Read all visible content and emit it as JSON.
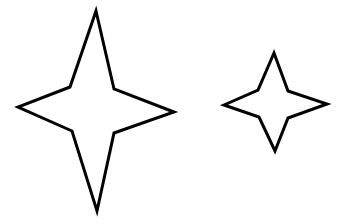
{
  "canvas": {
    "width": 341,
    "height": 224,
    "background_color": "#ffffff"
  },
  "figure": {
    "shape_count": 2,
    "stroke_color": "#000000",
    "fill_color": "#ffffff",
    "stroke_width": 3
  },
  "shapes": [
    {
      "name": "large-four-pointed-star",
      "label": "Large star",
      "points": 4,
      "center": {
        "x": 96,
        "y": 110
      },
      "bounding_box": {
        "x": 18,
        "y": 11,
        "width": 156,
        "height": 200
      },
      "tips": {
        "top": {
          "x": 96,
          "y": 11
        },
        "right": {
          "x": 174,
          "y": 112
        },
        "bottom": {
          "x": 97,
          "y": 211
        },
        "left": {
          "x": 18,
          "y": 107
        }
      },
      "inner_vertices": {
        "upper_left": {
          "x": 70,
          "y": 87
        },
        "upper_right": {
          "x": 114,
          "y": 89
        },
        "lower_right": {
          "x": 114,
          "y": 133
        },
        "lower_left": {
          "x": 72,
          "y": 131
        }
      },
      "polygon": "96,11 114,89 174,112 114,133 97,211 72,131 18,107 70,87"
    },
    {
      "name": "small-four-pointed-star",
      "label": "Small star",
      "points": 4,
      "center": {
        "x": 275,
        "y": 104
      },
      "bounding_box": {
        "x": 224,
        "y": 53,
        "width": 103,
        "height": 98
      },
      "tips": {
        "top": {
          "x": 274,
          "y": 53
        },
        "right": {
          "x": 327,
          "y": 104
        },
        "bottom": {
          "x": 275,
          "y": 151
        },
        "left": {
          "x": 224,
          "y": 105
        }
      },
      "inner_vertices": {
        "upper_left": {
          "x": 258,
          "y": 90
        },
        "upper_right": {
          "x": 288,
          "y": 91
        },
        "lower_right": {
          "x": 288,
          "y": 118
        },
        "lower_left": {
          "x": 259,
          "y": 117
        }
      },
      "polygon": "274,53 288,91 327,104 288,118 275,151 259,117 224,105 258,90"
    }
  ]
}
